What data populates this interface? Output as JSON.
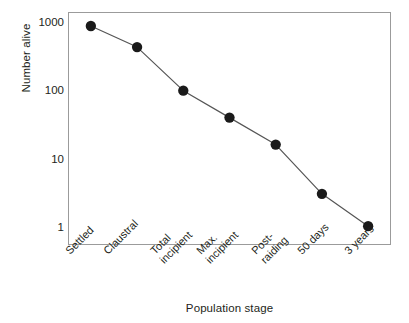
{
  "chart_data": {
    "type": "line",
    "title": "",
    "subtitle": "",
    "xlabel": "Population stage",
    "ylabel": "Number alive",
    "yscale": "log",
    "ylim": [
      1,
      1000
    ],
    "ytick_labels": [
      "1000",
      "100",
      "10",
      "1"
    ],
    "ytick_values": [
      1000,
      100,
      10,
      1
    ],
    "grid": false,
    "legend": "none",
    "marker": "filled-circle",
    "marker_color": "#1a1a1a",
    "line_color": "#555555",
    "categories": [
      "Settled",
      "Claustral",
      "Total incipient",
      "Max. incipient",
      "Post-raiding",
      "50 days",
      "3 years"
    ],
    "category_lines": [
      [
        "Settled"
      ],
      [
        "Claustral"
      ],
      [
        "Total",
        "incipient"
      ],
      [
        "Max.",
        "incipient"
      ],
      [
        "Post-",
        "raiding"
      ],
      [
        "50 days"
      ],
      [
        "3 years"
      ]
    ],
    "values": [
      900,
      440,
      100,
      40,
      16,
      3,
      1
    ],
    "series": [
      {
        "name": "Number alive",
        "values": [
          900,
          440,
          100,
          40,
          16,
          3,
          1
        ]
      }
    ],
    "annotations": []
  },
  "axes": {
    "y_title": "Number alive",
    "x_title": "Population stage"
  },
  "colors": {
    "frame": "#9b9b9b",
    "text": "#231f20",
    "marker": "#1a1a1a",
    "line": "#555555",
    "background": "#ffffff"
  }
}
